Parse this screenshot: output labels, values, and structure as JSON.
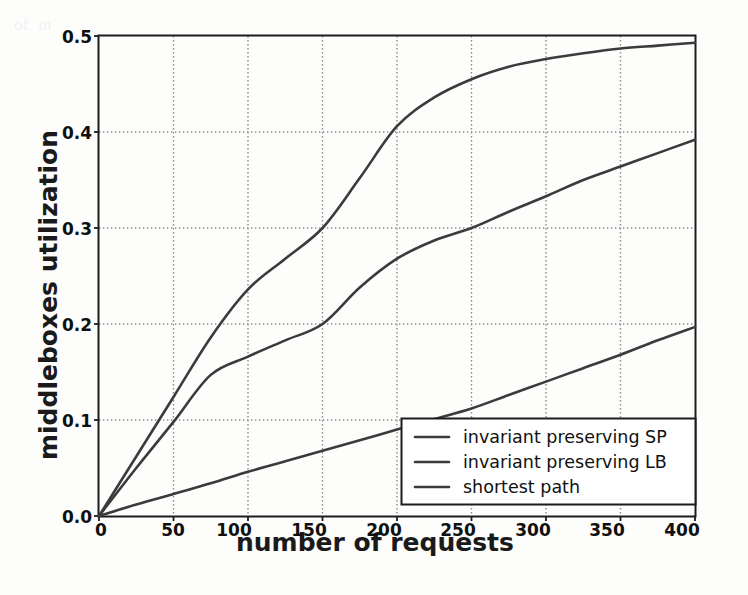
{
  "chart_data": {
    "type": "line",
    "title": "",
    "xlabel": "number of requests",
    "ylabel": "middleboxes utilization",
    "xlim": [
      0,
      400
    ],
    "ylim": [
      0.0,
      0.5
    ],
    "xticks": [
      0,
      50,
      100,
      150,
      200,
      250,
      300,
      350,
      400
    ],
    "xtick_labels": [
      "0",
      "50",
      "100",
      "150",
      "200",
      "250",
      "300",
      "350",
      "400"
    ],
    "yticks": [
      0.0,
      0.1,
      0.2,
      0.3,
      0.4,
      0.5
    ],
    "ytick_labels": [
      "0.0",
      "0.1",
      "0.2",
      "0.3",
      "0.4",
      "0.5"
    ],
    "grid": true,
    "grid_style": "dotted",
    "legend_position": "lower right",
    "x": [
      0,
      25,
      50,
      75,
      100,
      125,
      150,
      175,
      200,
      225,
      250,
      275,
      300,
      325,
      350,
      375,
      400
    ],
    "series": [
      {
        "name": "invariant preserving SP",
        "color": "#3b3b3b",
        "values": [
          0.0,
          0.062,
          0.124,
          0.186,
          0.236,
          0.268,
          0.3,
          0.352,
          0.406,
          0.436,
          0.455,
          0.468,
          0.476,
          0.482,
          0.487,
          0.49,
          0.493
        ]
      },
      {
        "name": "invariant preserving LB",
        "color": "#3b3b3b",
        "values": [
          0.0,
          0.05,
          0.098,
          0.147,
          0.166,
          0.183,
          0.2,
          0.238,
          0.268,
          0.287,
          0.3,
          0.317,
          0.333,
          0.35,
          0.364,
          0.378,
          0.392
        ]
      },
      {
        "name": "shortest path",
        "color": "#3b3b3b",
        "values": [
          0.0,
          0.012,
          0.023,
          0.034,
          0.046,
          0.057,
          0.068,
          0.079,
          0.09,
          0.101,
          0.112,
          0.126,
          0.14,
          0.154,
          0.168,
          0.183,
          0.197
        ]
      }
    ]
  },
  "legend": {
    "items": [
      {
        "label": "invariant preserving SP"
      },
      {
        "label": "invariant preserving LB"
      },
      {
        "label": "shortest path"
      }
    ]
  },
  "axes": {
    "ylabel": "middleboxes utilization",
    "xlabel": "number of requests",
    "ytick_labels": [
      "0.5",
      "0.4",
      "0.3",
      "0.2",
      "0.1",
      "0.0"
    ],
    "xtick_labels": [
      "0",
      "50",
      "100",
      "150",
      "200",
      "250",
      "300",
      "350",
      "400"
    ]
  },
  "colors": {
    "line": "#3b3b3b",
    "axis": "#1c1c1c",
    "grid": "#8a8a8a",
    "background": "#fdfdfc"
  },
  "background_text": "of  m                                      \n\n\n\n\n\n\n\n\n\n\n\n\n\n\n\n\n\n\n\n                                                                         \n"
}
